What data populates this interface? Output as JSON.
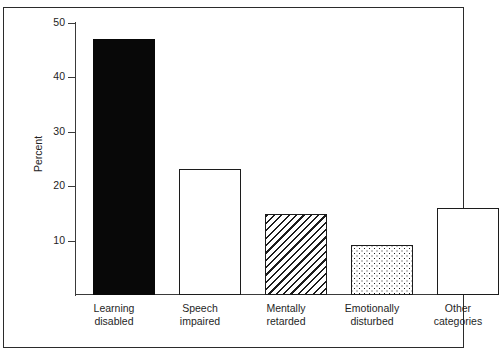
{
  "figure": {
    "cropped_header_fragment": "                                                                                                                       "
  },
  "axis": {
    "y_label": "Percent",
    "y_ticks": [
      "50",
      "40",
      "30",
      "20",
      "10"
    ],
    "y_tick_values": [
      50,
      40,
      30,
      20,
      10
    ]
  },
  "chart_data": {
    "type": "bar",
    "title": "",
    "xlabel": "",
    "ylabel": "Percent",
    "ylim": [
      0,
      52
    ],
    "grid": false,
    "legend": "none",
    "categories": [
      "Learning disabled",
      "Speech impaired",
      "Mentally retarded",
      "Emotionally disturbed",
      "Other categories"
    ],
    "category_lines": [
      [
        "Learning",
        "disabled"
      ],
      [
        "Speech",
        "impaired"
      ],
      [
        "Mentally",
        "retarded"
      ],
      [
        "Emotionally",
        "disturbed"
      ],
      [
        "Other",
        "categories"
      ]
    ],
    "values": [
      47.2,
      23.3,
      15.0,
      9.3,
      16.1
    ],
    "bar_fills": [
      "solid-black",
      "white",
      "diagonal-hatch",
      "dense-dots",
      "light-dots"
    ],
    "tick_labels_y": [
      "10",
      "20",
      "30",
      "40",
      "50"
    ]
  },
  "colors": {
    "bar_outline": "#1c1c1c",
    "bar_solid": "#080808",
    "axis": "#3a3a3a",
    "frame": "#2b2b2b",
    "text": "#1f1f1f",
    "background": "#ffffff"
  }
}
